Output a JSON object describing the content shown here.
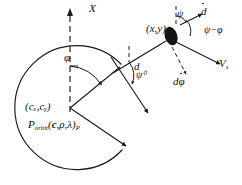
{
  "figure": {
    "domain": "Diagram",
    "type": "geometry-vector-diagram",
    "background_color": "#ffffff",
    "stroke_color": "#1a1a1a"
  },
  "labels": {
    "x_axis": "X",
    "phi": "φ",
    "center": "(cₓ,cᵧ)",
    "porbit_symbol": "P",
    "porbit_subscript": "orbit",
    "porbit_args_open": "(",
    "porbit_arg_c": "c",
    "porbit_arg_rho": "ρ",
    "porbit_arg_lambda": "λ",
    "porbit_args_close": ")",
    "porbit_trailing_subscript": "P",
    "porbit_full": "P_orbit(c,ρ,λ)_P",
    "d": "d",
    "psi_zero": "ψ⁰",
    "point_xy": "(x,y)",
    "psi_top": "ψ",
    "d_dot": "ḋ",
    "psi_minus_phi": "ψ−φ",
    "v_s": "Vₛ",
    "v_s_base": "V",
    "v_s_sub": "s",
    "d_dphi_dot": "dφ̇"
  },
  "geometry": {
    "circle": {
      "cx": 70,
      "cy": 108,
      "r": 62,
      "note": "main orbit circle, open gap on right side where radial arrows exit"
    },
    "center_point": {
      "x": 70,
      "y": 108
    },
    "target_point": {
      "x": 170,
      "y": 38
    },
    "x_axis_line": {
      "x1": 70,
      "y1": 108,
      "x2": 70,
      "y2": 10,
      "style": "dashed"
    },
    "radial_arrow_1": {
      "x1": 70,
      "y1": 108,
      "x2": 119,
      "y2": 68
    },
    "radial_arrow_2": {
      "x1": 70,
      "y1": 108,
      "x2": 128,
      "y2": 148
    },
    "line_d": {
      "x1": 119,
      "y1": 68,
      "x2": 166,
      "y2": 40
    },
    "tangent_arrow": {
      "x1": 110,
      "y1": 58,
      "x2": 148,
      "y2": 112
    },
    "vs_arrow": {
      "x1": 172,
      "y1": 44,
      "x2": 221,
      "y2": 66
    },
    "dphidot_arrow": {
      "x1": 172,
      "y1": 46,
      "x2": 188,
      "y2": 76,
      "style": "dashed"
    },
    "ddot_arrow": {
      "x1": 180,
      "y1": 24,
      "x2": 204,
      "y2": 13
    },
    "psi_ref_dash_top": {
      "x1": 178,
      "y1": 7,
      "x2": 178,
      "y2": 25,
      "style": "dashed"
    },
    "psi0_ref_dash_mid": {
      "x1": 129,
      "y1": 47,
      "x2": 129,
      "y2": 64,
      "style": "dashed"
    }
  }
}
